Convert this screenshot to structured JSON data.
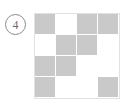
{
  "figure": {
    "index_label": "4",
    "index_icon": "circled-number-icon"
  },
  "colors": {
    "filled": "#c9c9c9",
    "empty": "#ffffff",
    "grid_border": "#e2e2e2",
    "cell_separator": "#ffffff",
    "badge_stroke": "#8c8c8c",
    "badge_text": "#6e6e6e",
    "background": "#ffffff"
  },
  "grid": {
    "rows": 4,
    "columns": 4,
    "legend": {
      "1": "filled",
      "0": "empty"
    },
    "pattern": [
      [
        1,
        0,
        1,
        1
      ],
      [
        0,
        1,
        1,
        0
      ],
      [
        1,
        1,
        0,
        0
      ],
      [
        1,
        0,
        0,
        1
      ]
    ],
    "cells": [
      {
        "row": 1,
        "col": 1,
        "state": "filled"
      },
      {
        "row": 1,
        "col": 2,
        "state": "empty"
      },
      {
        "row": 1,
        "col": 3,
        "state": "filled"
      },
      {
        "row": 1,
        "col": 4,
        "state": "filled"
      },
      {
        "row": 2,
        "col": 1,
        "state": "empty"
      },
      {
        "row": 2,
        "col": 2,
        "state": "filled"
      },
      {
        "row": 2,
        "col": 3,
        "state": "filled"
      },
      {
        "row": 2,
        "col": 4,
        "state": "empty"
      },
      {
        "row": 3,
        "col": 1,
        "state": "filled"
      },
      {
        "row": 3,
        "col": 2,
        "state": "filled"
      },
      {
        "row": 3,
        "col": 3,
        "state": "empty"
      },
      {
        "row": 3,
        "col": 4,
        "state": "empty"
      },
      {
        "row": 4,
        "col": 1,
        "state": "filled"
      },
      {
        "row": 4,
        "col": 2,
        "state": "empty"
      },
      {
        "row": 4,
        "col": 3,
        "state": "empty"
      },
      {
        "row": 4,
        "col": 4,
        "state": "filled"
      }
    ],
    "filled_count": 9,
    "empty_count": 7
  }
}
